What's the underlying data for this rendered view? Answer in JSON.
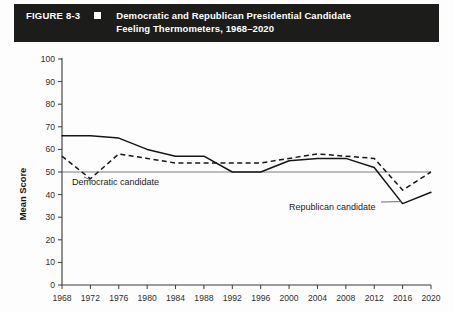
{
  "header": {
    "figure_number": "FIGURE 8-3",
    "marker_icon": "black-square-icon",
    "title_line1": "Democratic and Republican Presidential Candidate",
    "title_line2": "Feeling Thermometers, 1968–2020",
    "background_color": "#1c1c1a",
    "text_color": "#ffffff"
  },
  "chart_data": {
    "type": "line",
    "title": "Democratic and Republican Presidential Candidate Feeling Thermometers, 1968–2020",
    "xlabel": "",
    "ylabel": "Mean Score",
    "x": [
      1968,
      1972,
      1976,
      1980,
      1984,
      1988,
      1992,
      1996,
      2000,
      2004,
      2008,
      2012,
      2016,
      2020
    ],
    "categories": [
      "1968",
      "1972",
      "1976",
      "1980",
      "1984",
      "1988",
      "1992",
      "1996",
      "2000",
      "2004",
      "2008",
      "2012",
      "2016",
      "2020"
    ],
    "xlim": [
      1968,
      2020
    ],
    "ylim": [
      0,
      100
    ],
    "yticks": [
      0,
      10,
      20,
      30,
      40,
      50,
      60,
      70,
      80,
      90,
      100
    ],
    "ytick_labels": [
      "0",
      "10",
      "20",
      "30",
      "40",
      "50",
      "60",
      "70",
      "80",
      "90",
      "100"
    ],
    "grid": false,
    "legend": "none",
    "reference_line": {
      "value": 50,
      "label": ""
    },
    "series": [
      {
        "name": "Republican candidate",
        "style": "solid",
        "color": "#161616",
        "values": [
          66,
          66,
          65,
          60,
          57,
          57,
          50,
          50,
          55,
          56,
          56,
          52,
          36,
          41
        ]
      },
      {
        "name": "Democratic candidate",
        "style": "dashed",
        "color": "#161616",
        "values": [
          57,
          47,
          58,
          56,
          54,
          54,
          54,
          54,
          56,
          58,
          57,
          56,
          42,
          50
        ]
      }
    ],
    "annotations": [
      {
        "text": "Democratic candidate",
        "series": "Democratic candidate",
        "x": 1972,
        "y": 47
      },
      {
        "text": "Republican candidate",
        "series": "Republican candidate",
        "x": 2016,
        "y": 36
      }
    ]
  }
}
